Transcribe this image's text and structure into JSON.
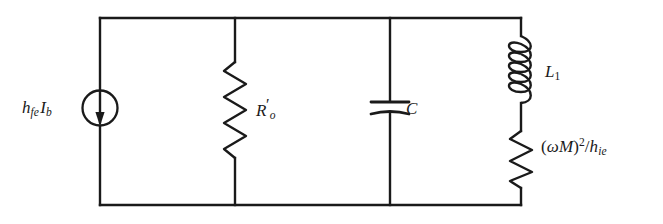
{
  "diagram": {
    "type": "schematic",
    "background_color": "#ffffff",
    "line_color": "#1a1a1a"
  },
  "labels": {
    "current_source": {
      "text": "h_fe I_b",
      "base_1": "h",
      "sub_1": "fe",
      "base_2": "I",
      "sub_2": "b"
    },
    "resistor_output": {
      "text": "R'_o",
      "base": "R",
      "prime": "′",
      "sub": "o"
    },
    "capacitor": {
      "text": "C",
      "base": "C"
    },
    "inductor": {
      "text": "L_1",
      "base": "L",
      "sub": "1"
    },
    "resistor_reflected": {
      "text": "(ωM)^2/h_ie",
      "open_paren": "(",
      "omega": "ω",
      "m": "M",
      "close_paren": ")",
      "exponent": "2",
      "slash": "/",
      "h": "h",
      "sub": "ie"
    }
  },
  "components": [
    {
      "name": "current-source",
      "symbol": "current-source-circle-arrow-down",
      "branch_x": 100,
      "label": "h_fe I_b",
      "label_position": "left"
    },
    {
      "name": "resistor-output",
      "symbol": "resistor-zigzag",
      "branch_x": 235,
      "label": "R'_o",
      "label_position": "right"
    },
    {
      "name": "capacitor",
      "symbol": "capacitor-parallel-plates",
      "branch_x": 390,
      "label": "C",
      "label_position": "right"
    },
    {
      "name": "inductor",
      "symbol": "inductor-coil",
      "branch_x": 521,
      "label": "L_1",
      "label_position": "right"
    },
    {
      "name": "resistor-reflected",
      "symbol": "resistor-zigzag",
      "branch_x": 521,
      "label": "(ωM)^2/h_ie",
      "label_position": "right"
    }
  ],
  "frame": {
    "left_x": 100,
    "right_x": 521,
    "top_y": 18,
    "bottom_y": 205
  }
}
